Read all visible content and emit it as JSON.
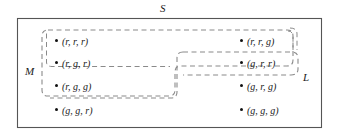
{
  "diagram": {
    "kind": "venn-set-diagram",
    "universe": {
      "label": "S",
      "label_name": "universe-label-s"
    },
    "regions": [
      {
        "label": "M",
        "name": "region-m",
        "style": "dashed"
      },
      {
        "label": "L",
        "name": "region-l",
        "style": "dashed"
      }
    ],
    "elements": [
      {
        "id": "e1",
        "tuple": "(r, r, r)",
        "col": "left",
        "row": 1,
        "in_m": true,
        "in_l": true
      },
      {
        "id": "e2",
        "tuple": "(r, g, r)",
        "col": "left",
        "row": 2,
        "in_m": true,
        "in_l": true
      },
      {
        "id": "e3",
        "tuple": "(r, g, g)",
        "col": "left",
        "row": 3,
        "in_m": true,
        "in_l": false
      },
      {
        "id": "e4",
        "tuple": "(g, g, r)",
        "col": "left",
        "row": 4,
        "in_m": false,
        "in_l": false
      },
      {
        "id": "e5",
        "tuple": "(r, r, g)",
        "col": "right",
        "row": 1,
        "in_m": true,
        "in_l": true
      },
      {
        "id": "e6",
        "tuple": "(g, r, r)",
        "col": "right",
        "row": 2,
        "in_m": true,
        "in_l": true
      },
      {
        "id": "e7",
        "tuple": "(g, r, g)",
        "col": "right",
        "row": 3,
        "in_m": false,
        "in_l": true
      },
      {
        "id": "e8",
        "tuple": "(g, g, g)",
        "col": "right",
        "row": 4,
        "in_m": false,
        "in_l": false
      }
    ],
    "colors": {
      "outline": "#555555",
      "dashed": "#8a8a8a",
      "text": "#1a1a1a",
      "background": "#ffffff"
    }
  }
}
